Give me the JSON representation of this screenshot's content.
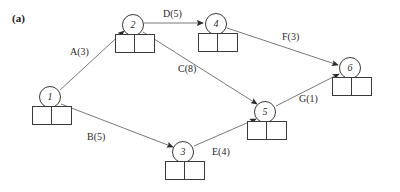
{
  "figure": {
    "caption": "(a)",
    "type": "activity-on-arrow-network-diagram"
  },
  "nodes": [
    {
      "id": "1",
      "label": "1",
      "cx": 50,
      "cy": 97,
      "box_x": 32,
      "box_y": 106
    },
    {
      "id": "2",
      "label": "2",
      "cx": 133,
      "cy": 25,
      "box_x": 115,
      "box_y": 34
    },
    {
      "id": "3",
      "label": "3",
      "cx": 183,
      "cy": 152,
      "box_x": 165,
      "box_y": 161
    },
    {
      "id": "4",
      "label": "4",
      "cx": 216,
      "cy": 24,
      "box_x": 198,
      "box_y": 33
    },
    {
      "id": "5",
      "label": "5",
      "cx": 265,
      "cy": 112,
      "box_x": 247,
      "box_y": 121
    },
    {
      "id": "6",
      "label": "6",
      "cx": 350,
      "cy": 68,
      "box_x": 332,
      "box_y": 77
    }
  ],
  "edges": [
    {
      "id": "A",
      "label": "A(3)",
      "from": "1",
      "to": "2",
      "duration": 3,
      "label_x": 70,
      "label_y": 47
    },
    {
      "id": "B",
      "label": "B(5)",
      "from": "1",
      "to": "3",
      "duration": 5,
      "label_x": 87,
      "label_y": 132
    },
    {
      "id": "C",
      "label": "C(8)",
      "from": "2",
      "to": "5",
      "duration": 8,
      "label_x": 178,
      "label_y": 64
    },
    {
      "id": "D",
      "label": "D(5)",
      "from": "2",
      "to": "4",
      "duration": 5,
      "label_x": 163,
      "label_y": 9
    },
    {
      "id": "E",
      "label": "E(4)",
      "from": "3",
      "to": "5",
      "duration": 4,
      "label_x": 212,
      "label_y": 147
    },
    {
      "id": "F",
      "label": "F(3)",
      "from": "4",
      "to": "6",
      "duration": 3,
      "label_x": 282,
      "label_y": 32
    },
    {
      "id": "G",
      "label": "G(1)",
      "from": "5",
      "to": "6",
      "duration": 1,
      "label_x": 299,
      "label_y": 94
    }
  ],
  "colors": {
    "stroke": "#3a3a3a",
    "text": "#2a2a2a",
    "background": "#ffffff"
  }
}
